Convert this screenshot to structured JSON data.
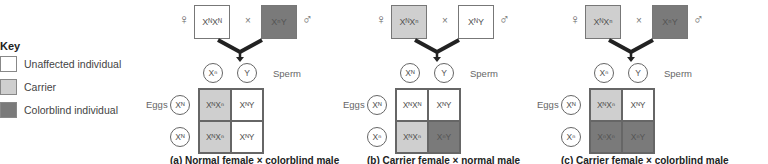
{
  "colors": {
    "unaffected": "#ffffff",
    "carrier": "#cfcfcf",
    "colorblind": "#7a7a7a"
  },
  "key": {
    "title": "Key",
    "items": [
      {
        "label": "Unaffected individual",
        "status": "unaffected"
      },
      {
        "label": "Carrier",
        "status": "carrier"
      },
      {
        "label": "Colorblind individual",
        "status": "colorblind"
      }
    ]
  },
  "labels": {
    "female_symbol": "♀",
    "male_symbol": "♂",
    "cross": "×",
    "sperm": "Sperm",
    "eggs": "Eggs"
  },
  "panels": [
    {
      "id": "a",
      "caption": "(a) Normal female × colorblind male",
      "female": {
        "genotype": "XᴺXᴺ",
        "status": "unaffected"
      },
      "male": {
        "genotype": "XⁿY",
        "status": "colorblind"
      },
      "sperm": [
        "Xⁿ",
        "Y"
      ],
      "eggs": [
        "Xᴺ",
        "Xᴺ"
      ],
      "offspring": [
        [
          {
            "genotype": "XᴺXⁿ",
            "status": "carrier"
          },
          {
            "genotype": "XᴺY",
            "status": "unaffected"
          }
        ],
        [
          {
            "genotype": "XᴺXⁿ",
            "status": "carrier"
          },
          {
            "genotype": "XᴺY",
            "status": "unaffected"
          }
        ]
      ]
    },
    {
      "id": "b",
      "caption": "(b) Carrier female × normal male",
      "female": {
        "genotype": "XᴺXⁿ",
        "status": "carrier"
      },
      "male": {
        "genotype": "XᴺY",
        "status": "unaffected"
      },
      "sperm": [
        "Xᴺ",
        "Y"
      ],
      "eggs": [
        "Xᴺ",
        "Xⁿ"
      ],
      "offspring": [
        [
          {
            "genotype": "XᴺXᴺ",
            "status": "unaffected"
          },
          {
            "genotype": "XᴺY",
            "status": "unaffected"
          }
        ],
        [
          {
            "genotype": "XᴺXⁿ",
            "status": "carrier"
          },
          {
            "genotype": "XⁿY",
            "status": "colorblind"
          }
        ]
      ]
    },
    {
      "id": "c",
      "caption": "(c) Carrier female × colorblind male",
      "female": {
        "genotype": "XᴺXⁿ",
        "status": "carrier"
      },
      "male": {
        "genotype": "XⁿY",
        "status": "colorblind"
      },
      "sperm": [
        "Xⁿ",
        "Y"
      ],
      "eggs": [
        "Xᴺ",
        "Xⁿ"
      ],
      "offspring": [
        [
          {
            "genotype": "XᴺXⁿ",
            "status": "carrier"
          },
          {
            "genotype": "XᴺY",
            "status": "unaffected"
          }
        ],
        [
          {
            "genotype": "XⁿXⁿ",
            "status": "colorblind"
          },
          {
            "genotype": "XⁿY",
            "status": "colorblind"
          }
        ]
      ]
    }
  ]
}
